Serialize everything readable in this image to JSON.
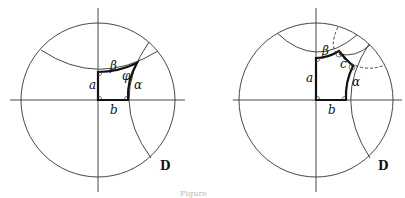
{
  "figures": [
    {
      "id": "left",
      "disk_label": "D",
      "labels": {
        "a": "a",
        "b": "b",
        "alpha": "α",
        "beta": "β",
        "phi": "φ"
      },
      "description": "Hyperbolic quadrilateral (Lambert quadrilateral) in Poincaré disk D with three right angles and angle φ"
    },
    {
      "id": "right",
      "disk_label": "D",
      "labels": {
        "a": "a",
        "b": "b",
        "c": "c",
        "alpha": "α",
        "beta": "β"
      },
      "description": "Right-angled hyperbolic pentagon in Poincaré disk D with sides a, b, α, c, β"
    }
  ],
  "caption": "Figure"
}
